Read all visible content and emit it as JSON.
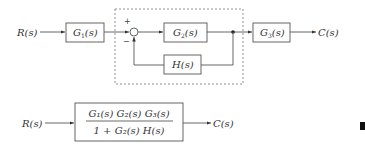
{
  "top_diagram": {
    "input_label": "R(s)",
    "output_label": "C(s)",
    "blocks": {
      "g1": {
        "name": "G",
        "sub": "1",
        "arg": "(s)"
      },
      "g2": {
        "name": "G",
        "sub": "2",
        "arg": "(s)"
      },
      "g3": {
        "name": "G",
        "sub": "3",
        "arg": "(s)"
      },
      "h": {
        "name": "H",
        "sub": "",
        "arg": "(s)"
      }
    },
    "summing_junction": {
      "plus": "+",
      "minus": "−"
    }
  },
  "bottom_diagram": {
    "input_label": "R(s)",
    "output_label": "C(s)",
    "numerator": "G₁(s) G₂(s) G₃(s)",
    "denominator": "1 + G₂(s) H(s)"
  },
  "colors": {
    "line": "#555555",
    "text": "#333333",
    "background": "#ffffff"
  }
}
